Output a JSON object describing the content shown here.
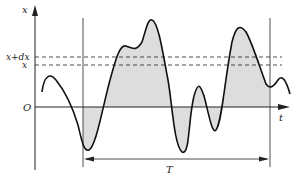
{
  "diagram": {
    "type": "random-signal-time-history",
    "axes": {
      "y_label": "x",
      "x_label": "t",
      "origin_label": "O"
    },
    "levels": [
      {
        "label": "x+dx",
        "description": "upper dashed level"
      },
      {
        "label": "x",
        "description": "lower dashed level"
      }
    ],
    "interval": {
      "label": "T",
      "description": "observation interval between two vertical lines"
    },
    "colors": {
      "curve": "#111111",
      "hatch": "#777777",
      "axes": "#222222"
    }
  }
}
